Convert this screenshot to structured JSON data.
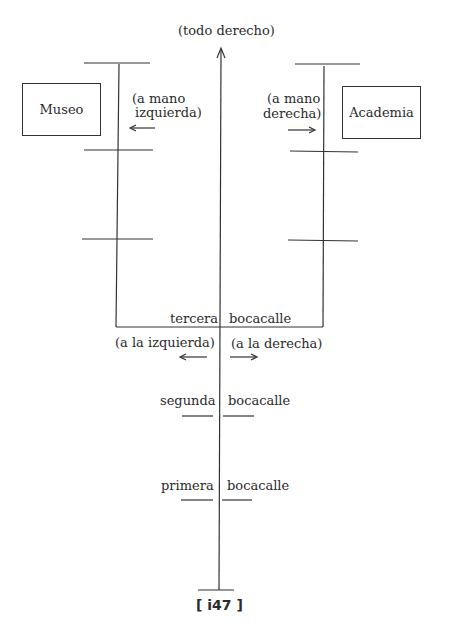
{
  "diagram": {
    "top_label": "(todo derecho)",
    "left_building": "Museo",
    "right_building": "Academia",
    "left_turn_label_line1": "(a mano",
    "left_turn_label_line2": "izquierda)",
    "right_turn_label_line1": "(a mano",
    "right_turn_label_line2": "derecha)",
    "third_left": "tercera",
    "third_right": "bocacalle",
    "third_dir_left": "(a la izquierda)",
    "third_dir_right": "(a la derecha)",
    "second_left": "segunda",
    "second_right": "bocacalle",
    "first_left": "primera",
    "first_right": "bocacalle",
    "page_number": "[ i47 ]"
  }
}
